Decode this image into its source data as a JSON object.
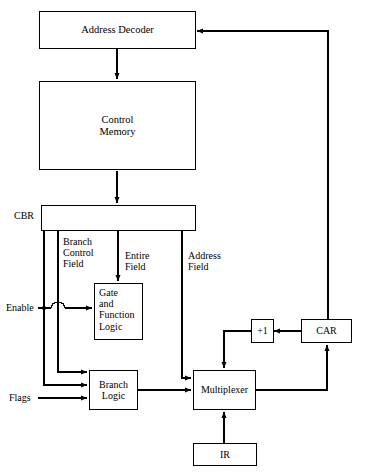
{
  "diagram": {
    "boxes": {
      "address_decoder": "Address Decoder",
      "control_memory": "Control\nMemory",
      "cbr": "CBR",
      "gate_function_logic": "Gate\nand\nFunction\nLogic",
      "branch_logic": "Branch\nLogic",
      "multiplexer": "Multiplexer",
      "incrementer": "+1",
      "car": "CAR",
      "ir": "IR"
    },
    "labels": {
      "branch_control_field": "Branch\nControl\nField",
      "entire_field": "Entire\nField",
      "address_field": "Address\nField",
      "enable": "Enable",
      "flags": "Flags"
    },
    "colors": {
      "stroke": "#000000",
      "background": "#ffffff",
      "dashed_divider": "#555555"
    }
  }
}
